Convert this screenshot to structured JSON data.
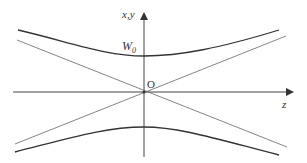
{
  "diagram": {
    "type": "gaussian-beam-waist",
    "labels": {
      "vertical_axis": "x,y",
      "horizontal_axis": "z",
      "waist": "W",
      "waist_subscript": "0",
      "origin": "O"
    },
    "colors": {
      "background": "#ffffff",
      "axes": "#444444",
      "beam_envelope": "#333333",
      "asymptotes": "#666666",
      "text": "#333333"
    }
  }
}
